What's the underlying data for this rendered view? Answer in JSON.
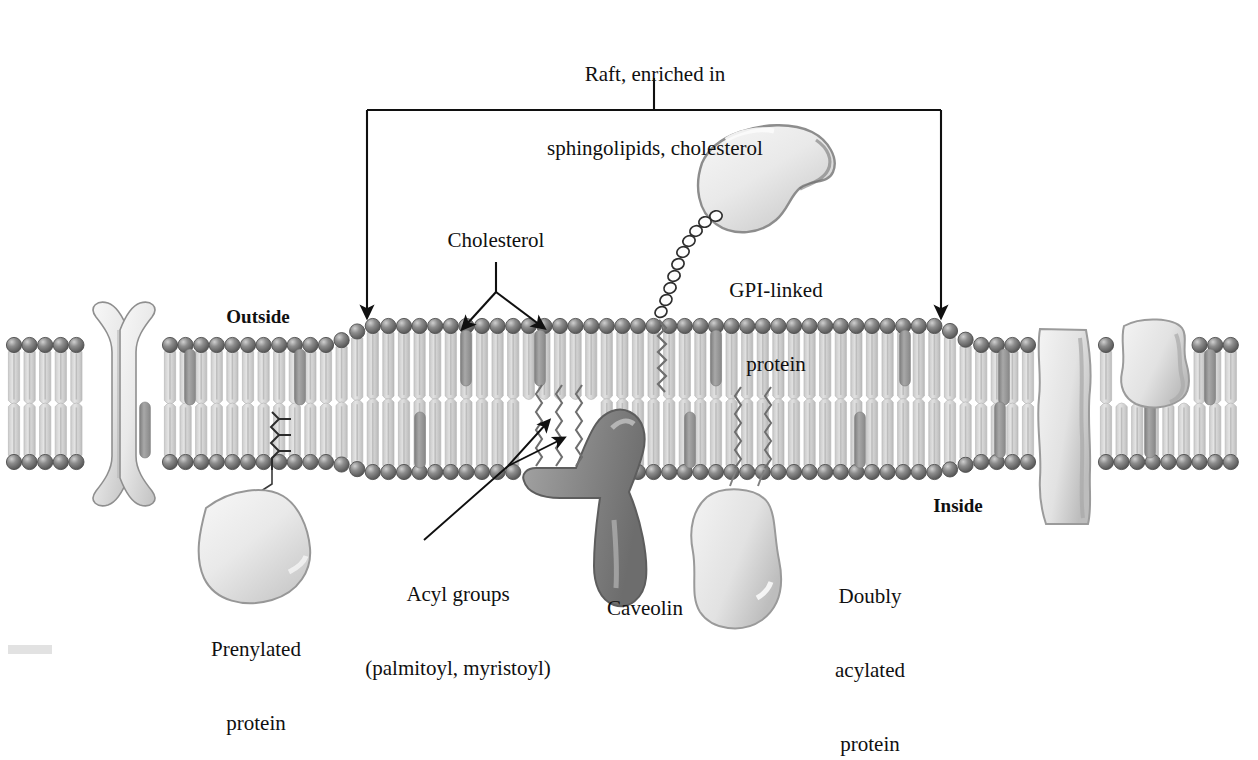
{
  "figure": {
    "background_color": "#ffffff"
  },
  "annotations": {
    "raft": {
      "line1": "Raft, enriched in",
      "line2": "sphingolipids, cholesterol",
      "font_size_px": 21
    },
    "cholesterol": {
      "label": "Cholesterol",
      "font_size_px": 21
    },
    "gpi": {
      "line1": "GPI-linked",
      "line2": "protein",
      "font_size_px": 21
    },
    "outside": {
      "label": "Outside",
      "font_size_px": 19,
      "bold": true
    },
    "inside": {
      "label": "Inside",
      "font_size_px": 19,
      "bold": true
    },
    "prenylated": {
      "line1": "Prenylated",
      "line2": "protein",
      "font_size_px": 21
    },
    "acyl": {
      "line1": "Acyl groups",
      "line2": "(palmitoyl, myristoyl)",
      "font_size_px": 21
    },
    "caveolin": {
      "label": "Caveolin",
      "font_size_px": 21
    },
    "doubly_acylated": {
      "line1": "Doubly",
      "line2": "acylated",
      "line3": "protein",
      "font_size_px": 21
    }
  },
  "colors": {
    "ink": "#101010",
    "head_group_dark": "#6f6f6f",
    "head_group_edge": "#4a4a4a",
    "head_group_highlight": "#c9c9c9",
    "tail_light": "#d6d6d6",
    "tail_mid": "#c2c2c2",
    "cholesterol_gray": "#9a9a9a",
    "protein_light": "#e8e8e8",
    "protein_edge": "#9c9c9c",
    "caveolin_gray": "#8c8c8c",
    "caveolin_edge": "#5f5f5f",
    "bottom_bar": "#e2e2e2"
  },
  "geometry": {
    "bracket": {
      "left_x": 367,
      "right_x": 941,
      "top_y": 110,
      "arrow_bottom_y": 322,
      "stem_top_y": 78
    },
    "membrane": {
      "left_x": 14,
      "right_x": 1244,
      "outer_y_flat": 345,
      "outer_y_raft": 326,
      "inner_y_flat": 462,
      "inner_y_raft": 472
    },
    "raft_span": {
      "start_x": 367,
      "end_x": 941
    }
  }
}
